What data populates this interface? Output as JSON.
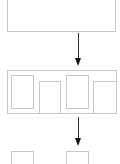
{
  "diagram": {
    "type": "flow",
    "stages": [
      {
        "id": "top-block",
        "label": ""
      },
      {
        "id": "split-blocks",
        "label": "",
        "children": 4
      },
      {
        "id": "output-blocks",
        "label": "",
        "children": 2
      }
    ],
    "arrows": [
      {
        "from": "top-block",
        "to": "split-blocks"
      },
      {
        "from": "split-blocks",
        "to": "output-blocks"
      }
    ],
    "colors": {
      "border": "#c8c8c8",
      "arrow": "#222222",
      "background": "#ffffff"
    }
  }
}
